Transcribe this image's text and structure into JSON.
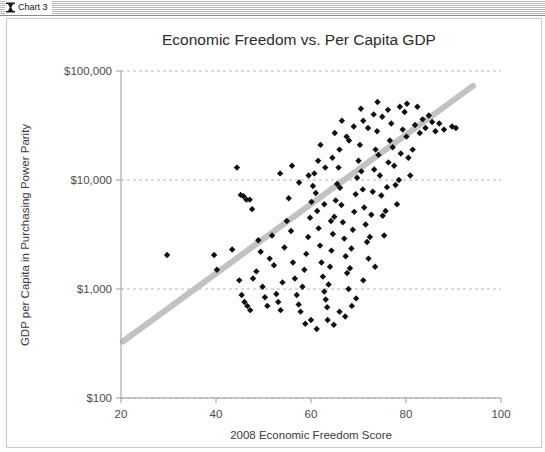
{
  "window": {
    "title": "Chart 3",
    "icon": "chart-window-icon"
  },
  "chart_data": {
    "type": "scatter",
    "title": "Economic Freedom vs. Per Capita GDP",
    "xlabel": "2008 Economic Freedom Score",
    "ylabel": "GDP per Capita in Purchasing Power Parity",
    "xlim": [
      20,
      100
    ],
    "ylim": [
      100,
      100000
    ],
    "yscale": "log",
    "xscale": "linear",
    "grid": true,
    "legend": "none",
    "xticks": [
      20,
      40,
      60,
      80,
      100
    ],
    "xtick_labels": [
      "20",
      "40",
      "60",
      "80",
      "100"
    ],
    "yticks": [
      100,
      1000,
      10000,
      100000
    ],
    "ytick_labels": [
      "$100",
      "$1,000",
      "$10,000",
      "$100,000"
    ],
    "marker": "diamond",
    "marker_color": "#111111",
    "trendline": {
      "type": "linear-on-log",
      "color": "#c2c2c2",
      "x_start": 20.4,
      "y_start": 330,
      "x_end": 94.1,
      "y_end": 73000
    },
    "points": [
      [
        29.7,
        2050
      ],
      [
        39.6,
        2050
      ],
      [
        43.4,
        2300
      ],
      [
        40.2,
        1500
      ],
      [
        44.4,
        13000
      ],
      [
        45.2,
        7300
      ],
      [
        45.8,
        7100
      ],
      [
        46.4,
        6600
      ],
      [
        47.1,
        6600
      ],
      [
        47.6,
        5400
      ],
      [
        44.9,
        1200
      ],
      [
        45.4,
        880
      ],
      [
        46.0,
        760
      ],
      [
        46.6,
        700
      ],
      [
        47.2,
        640
      ],
      [
        47.8,
        1250
      ],
      [
        48.5,
        1450
      ],
      [
        48.9,
        2800
      ],
      [
        49.4,
        2200
      ],
      [
        49.8,
        1050
      ],
      [
        50.3,
        840
      ],
      [
        50.8,
        700
      ],
      [
        51.3,
        1900
      ],
      [
        51.8,
        3100
      ],
      [
        52.2,
        1650
      ],
      [
        52.7,
        900
      ],
      [
        53.1,
        760
      ],
      [
        53.6,
        640
      ],
      [
        54.0,
        1150
      ],
      [
        54.4,
        2400
      ],
      [
        54.9,
        4200
      ],
      [
        55.3,
        6800
      ],
      [
        55.8,
        3400
      ],
      [
        56.2,
        1750
      ],
      [
        56.6,
        1250
      ],
      [
        57.0,
        880
      ],
      [
        57.4,
        720
      ],
      [
        57.8,
        620
      ],
      [
        58.2,
        1050
      ],
      [
        58.6,
        1500
      ],
      [
        59.0,
        2100
      ],
      [
        59.4,
        3000
      ],
      [
        59.8,
        4500
      ],
      [
        60.1,
        6300
      ],
      [
        60.4,
        8800
      ],
      [
        60.7,
        11500
      ],
      [
        61.0,
        7600
      ],
      [
        61.3,
        5200
      ],
      [
        61.6,
        3600
      ],
      [
        61.9,
        2500
      ],
      [
        62.2,
        1750
      ],
      [
        62.5,
        1300
      ],
      [
        62.8,
        950
      ],
      [
        63.1,
        800
      ],
      [
        63.4,
        680
      ],
      [
        63.7,
        1100
      ],
      [
        64.0,
        1600
      ],
      [
        64.3,
        2250
      ],
      [
        64.6,
        3200
      ],
      [
        64.9,
        4600
      ],
      [
        65.2,
        6500
      ],
      [
        65.5,
        9200
      ],
      [
        65.8,
        13000
      ],
      [
        66.1,
        8500
      ],
      [
        66.4,
        5900
      ],
      [
        66.7,
        4100
      ],
      [
        67.0,
        2900
      ],
      [
        67.3,
        2000
      ],
      [
        67.6,
        1400
      ],
      [
        67.9,
        1000
      ],
      [
        68.2,
        1550
      ],
      [
        68.5,
        2350
      ],
      [
        68.8,
        3500
      ],
      [
        69.1,
        5100
      ],
      [
        69.4,
        7400
      ],
      [
        69.7,
        10500
      ],
      [
        70.0,
        15000
      ],
      [
        70.3,
        21000
      ],
      [
        70.6,
        12000
      ],
      [
        70.9,
        8200
      ],
      [
        71.2,
        5600
      ],
      [
        71.5,
        3900
      ],
      [
        71.8,
        2700
      ],
      [
        72.1,
        1900
      ],
      [
        72.4,
        3000
      ],
      [
        72.7,
        4800
      ],
      [
        73.0,
        7800
      ],
      [
        73.3,
        12500
      ],
      [
        73.6,
        19000
      ],
      [
        73.9,
        28000
      ],
      [
        74.2,
        17000
      ],
      [
        74.5,
        11000
      ],
      [
        74.8,
        7200
      ],
      [
        75.1,
        4700
      ],
      [
        75.4,
        3100
      ],
      [
        75.7,
        5200
      ],
      [
        76.0,
        8600
      ],
      [
        76.3,
        14500
      ],
      [
        76.6,
        23000
      ],
      [
        76.9,
        33000
      ],
      [
        77.2,
        20000
      ],
      [
        77.5,
        13500
      ],
      [
        77.8,
        9000
      ],
      [
        78.1,
        6000
      ],
      [
        78.5,
        10000
      ],
      [
        78.9,
        17500
      ],
      [
        79.3,
        29000
      ],
      [
        79.7,
        42000
      ],
      [
        80.1,
        25000
      ],
      [
        80.5,
        16000
      ],
      [
        80.9,
        11000
      ],
      [
        81.4,
        19000
      ],
      [
        81.9,
        32000
      ],
      [
        82.4,
        47000
      ],
      [
        82.9,
        27000
      ],
      [
        83.5,
        36000
      ],
      [
        84.1,
        30000
      ],
      [
        84.8,
        39000
      ],
      [
        85.5,
        34000
      ],
      [
        86.2,
        28000
      ],
      [
        87.0,
        33000
      ],
      [
        88.0,
        29000
      ],
      [
        89.7,
        31000
      ],
      [
        90.5,
        30000
      ],
      [
        80.2,
        50000
      ],
      [
        78.7,
        47000
      ],
      [
        76.2,
        44000
      ],
      [
        75.0,
        38000
      ],
      [
        73.2,
        40000
      ],
      [
        71.0,
        35000
      ],
      [
        69.0,
        31000
      ],
      [
        67.5,
        25000
      ],
      [
        66.0,
        19000
      ],
      [
        64.5,
        16000
      ],
      [
        63.0,
        13000
      ],
      [
        61.5,
        15000
      ],
      [
        59.5,
        11000
      ],
      [
        57.5,
        9500
      ],
      [
        56.0,
        13500
      ],
      [
        53.5,
        11500
      ],
      [
        62.0,
        21000
      ],
      [
        65.0,
        27000
      ],
      [
        68.0,
        23000
      ],
      [
        70.5,
        45000
      ],
      [
        74.0,
        52000
      ],
      [
        66.5,
        35000
      ],
      [
        72.0,
        30000
      ],
      [
        62.8,
        6000
      ],
      [
        64.2,
        4200
      ],
      [
        60.0,
        520
      ],
      [
        64.8,
        470
      ],
      [
        67.2,
        560
      ],
      [
        61.2,
        430
      ],
      [
        58.8,
        480
      ],
      [
        63.5,
        520
      ],
      [
        66.0,
        620
      ],
      [
        68.6,
        700
      ],
      [
        71.0,
        1200
      ],
      [
        73.5,
        1600
      ],
      [
        69.5,
        820
      ]
    ]
  }
}
